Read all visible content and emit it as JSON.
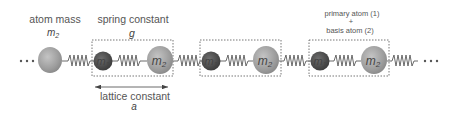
{
  "diagram": {
    "labels": {
      "atom_mass": "atom mass",
      "atom_mass_symbol": "m",
      "atom_mass_sub": "2",
      "spring_constant": "spring constant",
      "spring_constant_symbol": "g",
      "primary_atom": "primary atom (1)",
      "plus": "+",
      "basis_atom": "basis atom (2)",
      "lattice_constant": "lattice constant",
      "lattice_constant_symbol": "a",
      "ellipsis_left": "• • •",
      "ellipsis_right": "• • •"
    },
    "atoms": [
      {
        "id": "lead-m2",
        "symbol": "m",
        "sub": "2",
        "color": "#9a9a9a"
      },
      {
        "id": "cell1-m1",
        "symbol": "m",
        "sub": "1",
        "color": "#555555"
      },
      {
        "id": "cell1-m2",
        "symbol": "m",
        "sub": "2",
        "color": "#a0a0a0"
      },
      {
        "id": "cell2-m1",
        "symbol": "m",
        "sub": "1",
        "color": "#555555"
      },
      {
        "id": "cell2-m2",
        "symbol": "m",
        "sub": "2",
        "color": "#a0a0a0"
      },
      {
        "id": "cell3-m1",
        "symbol": "m",
        "sub": "1",
        "color": "#555555"
      },
      {
        "id": "cell3-m2",
        "symbol": "m",
        "sub": "2",
        "color": "#a0a0a0"
      }
    ],
    "unit_cells": 3,
    "colors": {
      "light_atom": "#a3a3a3",
      "dark_atom": "#555555",
      "spring": "#555555",
      "box": "#666666",
      "text": "#555555"
    }
  }
}
